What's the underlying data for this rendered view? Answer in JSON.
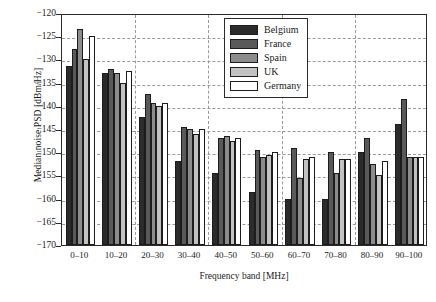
{
  "chart_data": {
    "type": "bar",
    "title": "",
    "xlabel": "Frequency band [MHz]",
    "ylabel": "Median noise PSD [dBm/Hz]",
    "categories": [
      "0–10",
      "10–20",
      "20–30",
      "30–40",
      "40–50",
      "50–60",
      "60–70",
      "70–80",
      "80–90",
      "90–100"
    ],
    "ylim": [
      -170,
      -120
    ],
    "yticks": [
      -120,
      -125,
      -130,
      -135,
      -140,
      -145,
      -150,
      -155,
      -160,
      -165,
      -170
    ],
    "ytick_labels": [
      "−120",
      "−125",
      "−130",
      "−135",
      "−140",
      "−145",
      "−150",
      "−155",
      "−160",
      "−165",
      "−170"
    ],
    "grid": true,
    "legend_position": "top-right",
    "series": [
      {
        "name": "Belgium",
        "color": "#2b2b2b",
        "values": [
          -131.5,
          -133.0,
          -142.5,
          -152.0,
          -154.5,
          -158.5,
          -160.0,
          -160.0,
          -150.0,
          -144.0
        ]
      },
      {
        "name": "France",
        "color": "#595959",
        "values": [
          -127.7,
          -132.0,
          -137.5,
          -144.5,
          -147.0,
          -149.5,
          -149.0,
          -150.0,
          -147.0,
          -138.5
        ]
      },
      {
        "name": "Spain",
        "color": "#8c8c8c",
        "values": [
          -123.5,
          -133.0,
          -139.5,
          -145.0,
          -146.5,
          -151.0,
          -155.5,
          -154.5,
          -152.5,
          -151.0
        ]
      },
      {
        "name": "UK",
        "color": "#c2c2c2",
        "values": [
          -130.0,
          -135.0,
          -140.0,
          -146.0,
          -147.5,
          -150.5,
          -151.5,
          -151.5,
          -155.0,
          -151.0
        ]
      },
      {
        "name": "Germany",
        "color": "#ffffff",
        "values": [
          -125.0,
          -132.5,
          -139.5,
          -145.0,
          -147.0,
          -150.0,
          -151.0,
          -151.5,
          -152.0,
          -151.0
        ]
      }
    ]
  },
  "legend": {
    "items": [
      {
        "label": "Belgium"
      },
      {
        "label": "France"
      },
      {
        "label": "Spain"
      },
      {
        "label": "UK"
      },
      {
        "label": "Germany"
      }
    ]
  }
}
